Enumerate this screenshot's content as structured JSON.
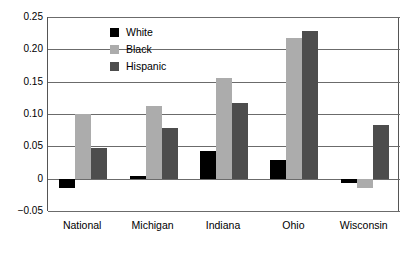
{
  "chart_data": {
    "type": "bar",
    "title": "",
    "subtitle": "",
    "xlabel": "",
    "ylabel": "",
    "categories": [
      "National",
      "Michigan",
      "Indiana",
      "Ohio",
      "Wisconsin"
    ],
    "series": [
      {
        "name": "White",
        "color": "#000000",
        "values": [
          -0.014,
          0.004,
          0.043,
          0.029,
          -0.006
        ]
      },
      {
        "name": "Black",
        "color": "#acacac",
        "values": [
          0.1,
          0.113,
          0.155,
          0.218,
          -0.015
        ]
      },
      {
        "name": "Hispanic",
        "color": "#4d4d4d",
        "values": [
          0.048,
          0.079,
          0.117,
          0.228,
          0.083
        ]
      }
    ],
    "ylim": [
      -0.05,
      0.25
    ],
    "yticks": [
      0.25,
      0.2,
      0.15,
      0.1,
      0.05,
      0,
      -0.05
    ],
    "ytick_labels": [
      "0.25",
      "0.20",
      "0.15",
      "0.10",
      "0.05",
      "0",
      "−0.05"
    ],
    "grid": true,
    "legend_position": "upper-center",
    "zero_line": 0
  },
  "legend": {
    "entries": [
      {
        "label": "White",
        "swatch": "white-swatch-icon"
      },
      {
        "label": "Black",
        "swatch": "black-swatch-icon"
      },
      {
        "label": "Hispanic",
        "swatch": "hispanic-swatch-icon"
      }
    ]
  }
}
